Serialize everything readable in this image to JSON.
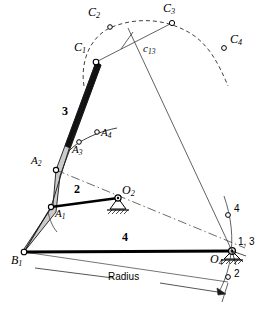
{
  "figure": {
    "type": "kinematic-linkage-synthesis-diagram",
    "background": "#ffffff",
    "ink": "#000000",
    "link3_fill": "#cfcfcf"
  },
  "points": [
    {
      "id": "C1",
      "base": "C",
      "sub": "1",
      "x": 96,
      "y": 62,
      "label_x": 74,
      "label_y": 50
    },
    {
      "id": "C2",
      "base": "C",
      "sub": "2",
      "x": 110,
      "y": 27,
      "label_x": 88,
      "label_y": 13
    },
    {
      "id": "C3",
      "base": "C",
      "sub": "3",
      "x": 172,
      "y": 23,
      "label_x": 165,
      "label_y": 7
    },
    {
      "id": "C4",
      "base": "C",
      "sub": "4",
      "x": 224,
      "y": 48,
      "label_x": 230,
      "label_y": 38
    },
    {
      "id": "A1",
      "base": "A",
      "sub": "1",
      "x": 51,
      "y": 207,
      "label_x": 55,
      "label_y": 210
    },
    {
      "id": "A2",
      "base": "A",
      "sub": "2",
      "x": 56,
      "y": 170,
      "label_x": 33,
      "label_y": 158
    },
    {
      "id": "A3",
      "base": "A",
      "sub": "3",
      "x": 79,
      "y": 142,
      "label_x": 74,
      "label_y": 145
    },
    {
      "id": "A4",
      "base": "A",
      "sub": "4",
      "x": 97,
      "y": 132,
      "label_x": 102,
      "label_y": 132
    },
    {
      "id": "B1",
      "base": "B",
      "sub": "1",
      "x": 24,
      "y": 252,
      "label_x": 13,
      "label_y": 256
    },
    {
      "id": "O2",
      "base": "O",
      "sub": "2",
      "x": 118,
      "y": 198,
      "label_x": 123,
      "label_y": 186
    },
    {
      "id": "O4",
      "base": "O",
      "sub": "4",
      "x": 232,
      "y": 251,
      "label_x": 212,
      "label_y": 255
    }
  ],
  "labels": {
    "c13": {
      "base": "c",
      "sub": "13",
      "x": 146,
      "y": 48
    },
    "link2": {
      "text": "2",
      "x": 76,
      "y": 190
    },
    "link3": {
      "text": "3",
      "x": 64,
      "y": 112
    },
    "link4": {
      "text": "4",
      "x": 124,
      "y": 233
    },
    "radius": {
      "text": "Radius",
      "x": 125,
      "y": 279
    },
    "pivot_1_3": {
      "text": "1, 3",
      "x": 240,
      "y": 243
    },
    "pivot_4": {
      "text": "4",
      "x": 235,
      "y": 209
    },
    "pivot_2": {
      "text": "2",
      "x": 235,
      "y": 272
    }
  },
  "markers": {
    "circle_4": {
      "x": 228,
      "y": 215
    },
    "circle_2": {
      "x": 228,
      "y": 277
    }
  },
  "geometry": {
    "ground_link_from": "B1",
    "ground_link_to": "O4",
    "coupler_curve": "dashed arc through C1 C2 C3 C4",
    "a_curve": "solid arc through A1 A2 A3 A4",
    "bisector": "c13 perpendicular bisector of C1-C3 passing to O4"
  }
}
